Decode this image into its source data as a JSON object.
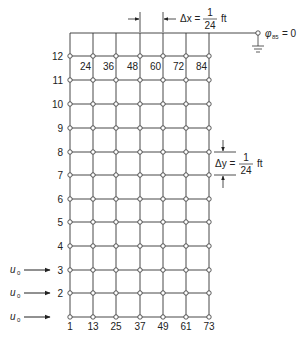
{
  "diagram": {
    "grid": {
      "columns_x": [
        70,
        93,
        116,
        140,
        163,
        186,
        209
      ],
      "rows_y": [
        317,
        293,
        270,
        246,
        222,
        199,
        175,
        152,
        128,
        104,
        80,
        56
      ],
      "top_boundary_y": 33,
      "line_color": "#333333"
    },
    "row_labels": [
      "1",
      "2",
      "3",
      "4",
      "5",
      "6",
      "7",
      "8",
      "9",
      "10",
      "11",
      "12"
    ],
    "top_node_labels": [
      "24",
      "36",
      "48",
      "60",
      "72",
      "84"
    ],
    "bottom_node_labels": [
      "1",
      "13",
      "25",
      "37",
      "49",
      "61",
      "73"
    ],
    "dx_label": {
      "prefix": "Δx =",
      "numerator": "1",
      "denominator": "24",
      "unit": "ft"
    },
    "dy_label": {
      "prefix": "Δy =",
      "numerator": "1",
      "denominator": "24",
      "unit": "ft"
    },
    "ground_node": {
      "symbol": "φ",
      "subscript": "85",
      "equals": "= 0"
    },
    "inflow_arrows": [
      {
        "label": "u",
        "subscript": "0",
        "row": 3
      },
      {
        "label": "u",
        "subscript": "0",
        "row": 2
      },
      {
        "label": "u",
        "subscript": "0",
        "row": 1
      }
    ]
  }
}
